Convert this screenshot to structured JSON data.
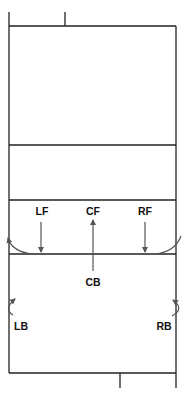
{
  "diagram": {
    "colors": {
      "lines": "#222222",
      "arrows": "#555555",
      "labels": "#111111",
      "background": "#ffffff"
    },
    "court": {
      "left_x": 9,
      "right_x": 176,
      "top_y": 26,
      "bottom_y": 373,
      "inner_lines_y": [
        145,
        200,
        254
      ]
    },
    "positions": {
      "left_front": {
        "label": "LF",
        "arrow": "down"
      },
      "center_front": {
        "label": "CF",
        "arrow": "up-from-CB"
      },
      "right_front": {
        "label": "RF",
        "arrow": "down"
      },
      "center_back": {
        "label": "CB"
      },
      "left_back": {
        "label": "LB",
        "arrow": "curl-up"
      },
      "right_back": {
        "label": "RB",
        "arrow": "curl-up"
      }
    }
  }
}
